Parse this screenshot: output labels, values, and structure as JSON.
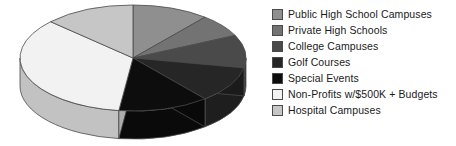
{
  "chart_data": {
    "type": "pie",
    "title": "",
    "subtitle": "",
    "xlabel": "",
    "ylabel": "",
    "legend_position": "right",
    "grid": false,
    "three_d": true,
    "start_angle_deg": 0,
    "direction": "clockwise",
    "categories": [
      "Public High School Campuses",
      "Private High Schools",
      "College Campuses",
      "Golf Courses",
      "Special Events",
      "Non-Profits w/$500K + Budgets",
      "Hospital Campuses"
    ],
    "values": [
      11,
      7,
      10,
      11,
      13,
      35,
      13
    ],
    "slices": [
      {
        "label": "Public High School Campuses",
        "value": 11,
        "color": "#8f8f8f",
        "start_deg": 0,
        "end_deg": 39.6
      },
      {
        "label": "Private High Schools",
        "value": 7,
        "color": "#737373",
        "start_deg": 39.6,
        "end_deg": 64.8
      },
      {
        "label": "College Campuses",
        "value": 10,
        "color": "#4a4a4a",
        "start_deg": 64.8,
        "end_deg": 100.8
      },
      {
        "label": "Golf Courses",
        "value": 11,
        "color": "#262626",
        "start_deg": 100.8,
        "end_deg": 140.4
      },
      {
        "label": "Special Events",
        "value": 13,
        "color": "#0d0d0d",
        "start_deg": 140.4,
        "end_deg": 187.2
      },
      {
        "label": "Non-Profits w/$500K + Budgets",
        "value": 35,
        "color": "#f2f2f2",
        "start_deg": 187.2,
        "end_deg": 313.2
      },
      {
        "label": "Hospital Campuses",
        "value": 13,
        "color": "#c6c6c6",
        "start_deg": 313.2,
        "end_deg": 360
      }
    ]
  },
  "legend": {
    "items": [
      {
        "label": "Public High School Campuses",
        "color": "#8f8f8f"
      },
      {
        "label": "Private High Schools",
        "color": "#737373"
      },
      {
        "label": "College Campuses",
        "color": "#4a4a4a"
      },
      {
        "label": "Golf Courses",
        "color": "#262626"
      },
      {
        "label": "Special Events",
        "color": "#0d0d0d"
      },
      {
        "label": "Non-Profits w/$500K + Budgets",
        "color": "#f2f2f2"
      },
      {
        "label": "Hospital Campuses",
        "color": "#c6c6c6"
      }
    ]
  },
  "colors": {
    "background": "#ffffff",
    "outline": "#4a4a4a",
    "text": "#1a1a1a"
  }
}
